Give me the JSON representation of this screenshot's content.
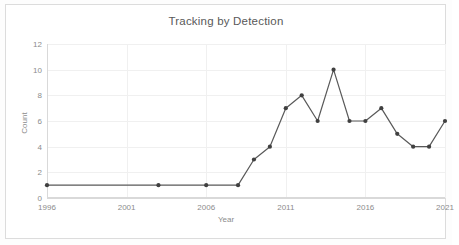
{
  "card": {
    "background_color": "#ffffff",
    "border_color": "#dcdcdc"
  },
  "chart_data": {
    "type": "line",
    "title": "Tracking by Detection",
    "xlabel": "Year",
    "ylabel": "Count",
    "x": [
      1996,
      1997,
      1998,
      1999,
      2000,
      2001,
      2002,
      2003,
      2004,
      2005,
      2006,
      2007,
      2008,
      2009,
      2010,
      2011,
      2012,
      2013,
      2014,
      2015,
      2016,
      2017,
      2018,
      2019,
      2020,
      2021
    ],
    "values": [
      1,
      1,
      1,
      1,
      1,
      1,
      1,
      1,
      1,
      1,
      1,
      1,
      1,
      3,
      4,
      7,
      8,
      6,
      10,
      6,
      6,
      7,
      5,
      4,
      4,
      6
    ],
    "marker_x": [
      1996,
      2003,
      2006,
      2008,
      2009,
      2010,
      2011,
      2012,
      2013,
      2014,
      2015,
      2016,
      2017,
      2018,
      2019,
      2020,
      2021
    ],
    "marker_values": [
      1,
      1,
      1,
      1,
      3,
      4,
      7,
      8,
      6,
      10,
      6,
      6,
      7,
      5,
      4,
      4,
      6
    ],
    "xlim": [
      1996,
      2021
    ],
    "ylim": [
      0,
      12
    ],
    "ytick_labels": [
      "0",
      "2",
      "4",
      "6",
      "8",
      "10",
      "12"
    ],
    "ytick_values": [
      0,
      2,
      4,
      6,
      8,
      10,
      12
    ],
    "xtick_labels": [
      "1996",
      "2001",
      "2006",
      "2011",
      "2016",
      "2021"
    ],
    "xtick_values": [
      1996,
      2001,
      2006,
      2011,
      2016,
      2021
    ],
    "grid": true,
    "legend": false,
    "line_color": "#595959",
    "marker_color": "#404040",
    "grid_color": "#f0f0f0",
    "axis_color": "#d9d9d9",
    "tick_label_color": "#8c8c8c",
    "title_color": "#595959"
  }
}
